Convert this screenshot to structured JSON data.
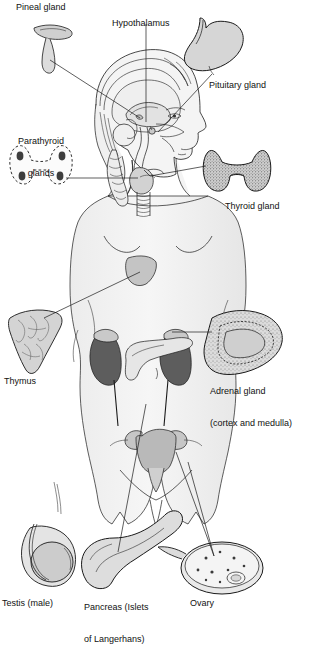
{
  "figure": {
    "caption_partial": "...",
    "colors": {
      "outline": "#1a1a1a",
      "body_fill": "#f2f2f2",
      "organ_light": "#d6d6d6",
      "organ_mid": "#b5b5b5",
      "kidney_dark": "#5d5d5d",
      "text": "#111111",
      "leader": "#1a1a1a"
    }
  },
  "labels": {
    "pineal": "Pineal gland",
    "hypothalamus": "Hypothalamus",
    "pituitary": "Pituitary gland",
    "parathyroid_line1": "Parathyroid",
    "parathyroid_line2": "glands",
    "thyroid": "Thyroid gland",
    "thymus": "Thymus",
    "adrenal_line1": "Adrenal gland",
    "adrenal_line2": "(cortex and medulla)",
    "testis": "Testis (male)",
    "pancreas_line1": "Pancreas (Islets",
    "pancreas_line2": "of Langerhans)",
    "ovary": "Ovary"
  },
  "organs": [
    {
      "name": "pineal-gland",
      "label": "Pineal gland",
      "side": "left",
      "detail": "small curved gland, upper left"
    },
    {
      "name": "hypothalamus",
      "label": "Hypothalamus",
      "side": "center",
      "detail": "indicated in mid-brain via vertical leader"
    },
    {
      "name": "pituitary-gland",
      "label": "Pituitary gland",
      "side": "right",
      "detail": "bulb with stalk, upper right"
    },
    {
      "name": "parathyroid-glands",
      "label": "Parathyroid glands",
      "side": "left",
      "detail": "dashed thyroid outline with four dark ovals"
    },
    {
      "name": "thyroid-gland",
      "label": "Thyroid gland",
      "side": "right",
      "detail": "stippled butterfly shape"
    },
    {
      "name": "thymus",
      "label": "Thymus",
      "side": "left",
      "detail": "lobulated triangular gland"
    },
    {
      "name": "adrenal-gland",
      "label": "Adrenal gland (cortex and medulla)",
      "side": "right",
      "detail": "crescent in cross-section showing cortex and medulla"
    },
    {
      "name": "pancreas",
      "label": "Pancreas (Islets of Langerhans)",
      "side": "center",
      "detail": "elongated tapering gland"
    },
    {
      "name": "ovary",
      "label": "Ovary",
      "side": "right",
      "detail": "oval in cross-section with follicles"
    },
    {
      "name": "testis",
      "label": "Testis (male)",
      "side": "left",
      "detail": "oval gland with epididymis and duct"
    }
  ]
}
